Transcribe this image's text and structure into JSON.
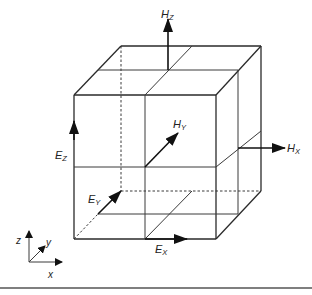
{
  "figure": {
    "type": "Yee cell (3D FDTD unit cell) with staggered E and H field components",
    "labels": {
      "hz": {
        "main": "H",
        "sub": "Z"
      },
      "hy": {
        "main": "H",
        "sub": "Y"
      },
      "hx": {
        "main": "H",
        "sub": "X"
      },
      "ez": {
        "main": "E",
        "sub": "Z"
      },
      "ey": {
        "main": "E",
        "sub": "Y"
      },
      "ex": {
        "main": "E",
        "sub": "X"
      }
    },
    "axes": {
      "z": "z",
      "y": "y",
      "x": "x"
    }
  },
  "colors": {
    "line": "#2a2a2a",
    "arrow": "#111111",
    "background": "#ffffff"
  }
}
